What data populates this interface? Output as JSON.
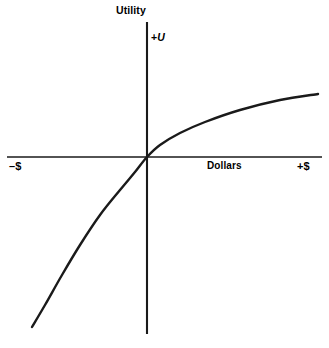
{
  "figure": {
    "background_color": "#ffffff",
    "line_color": "#1a1a1a",
    "width": 329,
    "height": 348
  },
  "labels": {
    "utility": "Utility",
    "positive_utility": "+",
    "positive_utility_symbol": "U",
    "negative_dollars": "–$",
    "dollars": "Dollars",
    "positive_dollars": "+$"
  },
  "chart_data": {
    "type": "line",
    "title": "",
    "subtitle": "",
    "xlabel": "Dollars",
    "ylabel": "Utility",
    "grid": false,
    "legend": null,
    "annotations": [
      {
        "text": "Utility",
        "position": "above-y-axis-top",
        "bold": true
      },
      {
        "text": "+U",
        "position": "right-of-y-axis-upper",
        "italic_part": "U"
      },
      {
        "text": "–$",
        "position": "x-axis-left-end",
        "bold": true
      },
      {
        "text": "Dollars",
        "position": "x-axis-right-center",
        "bold": true
      },
      {
        "text": "+$",
        "position": "x-axis-right-end",
        "bold": true
      }
    ],
    "axes": {
      "x_axis": {
        "orientation": "horizontal",
        "pixel_y": 157,
        "pixel_x_start": 7,
        "pixel_x_end": 322,
        "origin_pixel_x": 147,
        "ticks": [],
        "tick_labels": []
      },
      "y_axis": {
        "orientation": "vertical",
        "pixel_x": 147,
        "pixel_y_start": 22,
        "pixel_y_end": 334,
        "origin_pixel_y": 157,
        "ticks": [],
        "tick_labels": []
      }
    },
    "xlim": [
      -1.0,
      1.15
    ],
    "ylim": [
      -1.25,
      0.85
    ],
    "curve_name": "utility-of-money",
    "series": [
      {
        "name": "Utility of money",
        "x": [
          -1.0,
          -0.9,
          -0.8,
          -0.7,
          -0.6,
          -0.5,
          -0.4,
          -0.3,
          -0.2,
          -0.1,
          0.0,
          0.1,
          0.2,
          0.3,
          0.4,
          0.5,
          0.6,
          0.7,
          0.8,
          0.9,
          1.0
        ],
        "y": [
          -1.2,
          -1.02,
          -0.86,
          -0.72,
          -0.59,
          -0.47,
          -0.36,
          -0.26,
          -0.16,
          -0.08,
          0.0,
          0.1,
          0.19,
          0.27,
          0.34,
          0.41,
          0.47,
          0.53,
          0.58,
          0.63,
          0.68
        ]
      }
    ],
    "pixel_points": [
      {
        "x": 32,
        "y": 327
      },
      {
        "x": 45,
        "y": 305
      },
      {
        "x": 62,
        "y": 275
      },
      {
        "x": 80,
        "y": 245
      },
      {
        "x": 100,
        "y": 215
      },
      {
        "x": 120,
        "y": 190
      },
      {
        "x": 135,
        "y": 172
      },
      {
        "x": 147,
        "y": 157
      },
      {
        "x": 160,
        "y": 145
      },
      {
        "x": 180,
        "y": 133
      },
      {
        "x": 205,
        "y": 122
      },
      {
        "x": 240,
        "y": 110
      },
      {
        "x": 280,
        "y": 100
      },
      {
        "x": 318,
        "y": 94
      }
    ]
  }
}
